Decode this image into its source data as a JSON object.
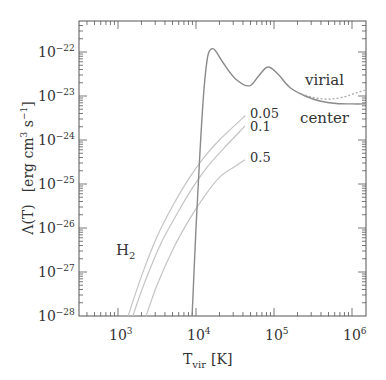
{
  "chart_data": {
    "type": "line",
    "title": "",
    "xlabel": "T_vir [K]",
    "ylabel": "Λ(T)  [erg cm^3 s^-1]",
    "xscale": "log",
    "yscale": "log",
    "xlim": [
      316,
      1500000
    ],
    "ylim": [
      1e-28,
      5e-22
    ],
    "grid": false,
    "legend": "none (inline annotations)",
    "x_ticks": [
      {
        "base": "10",
        "exp": "3",
        "value": 1000
      },
      {
        "base": "10",
        "exp": "4",
        "value": 10000
      },
      {
        "base": "10",
        "exp": "5",
        "value": 100000
      },
      {
        "base": "10",
        "exp": "6",
        "value": 1000000
      }
    ],
    "y_ticks": [
      {
        "base": "10",
        "exp": "−22",
        "value": 1e-22
      },
      {
        "base": "10",
        "exp": "−23",
        "value": 1e-23
      },
      {
        "base": "10",
        "exp": "−24",
        "value": 1e-24
      },
      {
        "base": "10",
        "exp": "−25",
        "value": 1e-25
      },
      {
        "base": "10",
        "exp": "−26",
        "value": 1e-26
      },
      {
        "base": "10",
        "exp": "−27",
        "value": 1e-27
      },
      {
        "base": "10",
        "exp": "−28",
        "value": 1e-28
      }
    ],
    "series": [
      {
        "name": "center",
        "style": "solid",
        "color": "#8a8a8a",
        "log_x": [
          3.95,
          4.0,
          4.05,
          4.1,
          4.15,
          4.2,
          4.25,
          4.35,
          4.5,
          4.68,
          4.8,
          4.92,
          5.05,
          5.2,
          5.4,
          5.6,
          5.8,
          6.0,
          6.18
        ],
        "log_y": [
          -28.0,
          -26.0,
          -24.3,
          -22.9,
          -22.1,
          -21.93,
          -21.97,
          -22.25,
          -22.6,
          -22.77,
          -22.55,
          -22.34,
          -22.5,
          -22.8,
          -23.0,
          -23.12,
          -23.17,
          -23.18,
          -23.18
        ]
      },
      {
        "name": "virial",
        "style": "dotted",
        "color": "#aaaaaa",
        "log_x": [
          5.3,
          5.5,
          5.7,
          5.9,
          6.05,
          6.18
        ],
        "log_y": [
          -22.92,
          -23.03,
          -23.07,
          -23.02,
          -22.93,
          -22.86
        ]
      },
      {
        "name": "H2 0.05",
        "style": "solid",
        "color": "#c4c4c4",
        "log_x": [
          3.13,
          3.3,
          3.5,
          3.7,
          3.9,
          4.1,
          4.3,
          4.63
        ],
        "log_y": [
          -28.0,
          -27.1,
          -26.2,
          -25.5,
          -24.9,
          -24.4,
          -24.0,
          -23.45
        ]
      },
      {
        "name": "H2 0.1",
        "style": "solid",
        "color": "#c4c4c4",
        "log_x": [
          3.19,
          3.35,
          3.55,
          3.75,
          3.95,
          4.15,
          4.35,
          4.63
        ],
        "log_y": [
          -28.0,
          -27.2,
          -26.35,
          -25.7,
          -25.1,
          -24.6,
          -24.2,
          -23.68
        ]
      },
      {
        "name": "H2 0.5",
        "style": "solid",
        "color": "#c4c4c4",
        "log_x": [
          3.36,
          3.5,
          3.7,
          3.9,
          4.1,
          4.3,
          4.5,
          4.63
        ],
        "log_y": [
          -28.0,
          -27.3,
          -26.5,
          -25.85,
          -25.3,
          -24.85,
          -24.6,
          -24.45
        ]
      }
    ],
    "annotations": [
      {
        "text": "virial",
        "log_x": 5.4,
        "log_y": -22.75
      },
      {
        "text": "center",
        "log_x": 5.35,
        "log_y": -23.55
      },
      {
        "text": "0.05",
        "log_x": 4.7,
        "log_y": -23.4
      },
      {
        "text": "0.1",
        "log_x": 4.7,
        "log_y": -23.7
      },
      {
        "text": "0.5",
        "log_x": 4.7,
        "log_y": -24.4
      },
      {
        "text": "H2",
        "log_x": 3.07,
        "log_y": -26.5
      }
    ]
  },
  "labels": {
    "xlabel_main": "T",
    "xlabel_sub": "vir",
    "xlabel_unit": "[K]",
    "ylabel_main": "Λ(T)",
    "ylabel_unit_a": "[erg cm",
    "ylabel_unit_sup1": "3",
    "ylabel_unit_b": " s",
    "ylabel_unit_sup2": "−1",
    "ylabel_unit_c": "]",
    "virial": "virial",
    "center": "center",
    "h2_main": "H",
    "h2_sub": "2",
    "frac_005": "0.05",
    "frac_01": "0.1",
    "frac_05": "0.5"
  }
}
